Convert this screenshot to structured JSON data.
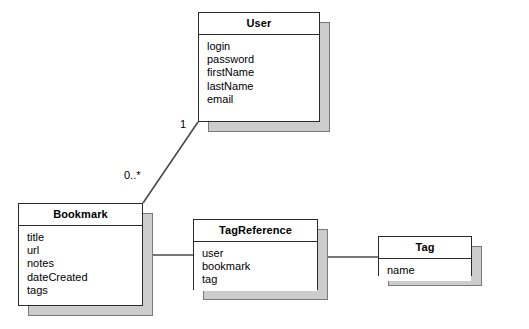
{
  "diagram": {
    "type": "uml-class-diagram",
    "background_color": "#ffffff",
    "box_fill_color": "#ffffff",
    "box_border_color": "#2b2b2b",
    "shadow_color": "#cccccc",
    "line_color": "#4a4a4a",
    "classes": [
      {
        "id": "user",
        "name": "User",
        "attributes": [
          "login",
          "password",
          "firstName",
          "lastName",
          "email"
        ]
      },
      {
        "id": "bookmark",
        "name": "Bookmark",
        "attributes": [
          "title",
          "url",
          "notes",
          "dateCreated",
          "tags"
        ]
      },
      {
        "id": "tagreference",
        "name": "TagReference",
        "attributes": [
          "user",
          "bookmark",
          "tag"
        ]
      },
      {
        "id": "tag",
        "name": "Tag",
        "attributes": [
          "name"
        ]
      }
    ],
    "associations": [
      {
        "id": "user-bookmark",
        "from": "User",
        "to": "Bookmark",
        "from_multiplicity": "1",
        "to_multiplicity": "0..*"
      },
      {
        "id": "bookmark-tagreference",
        "from": "Bookmark",
        "to": "TagReference",
        "from_multiplicity": "",
        "to_multiplicity": ""
      },
      {
        "id": "tagreference-tag",
        "from": "TagReference",
        "to": "Tag",
        "from_multiplicity": "",
        "to_multiplicity": ""
      }
    ],
    "multiplicity_labels": {
      "user_end": "1",
      "bookmark_end": "0..*"
    }
  }
}
